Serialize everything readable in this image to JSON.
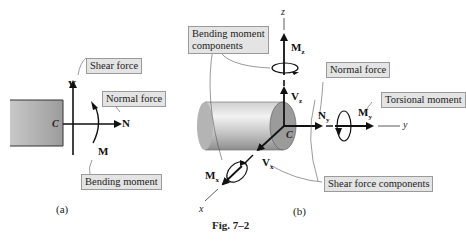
{
  "figure": {
    "title": "Fig. 7–2",
    "panel_a": {
      "caption": "(a)",
      "point_label": "C",
      "symbols": {
        "shear": "V",
        "normal": "N",
        "moment": "M"
      },
      "callouts": {
        "shear_force": "Shear force",
        "normal_force": "Normal force",
        "bending_moment": "Bending moment"
      }
    },
    "panel_b": {
      "caption": "(b)",
      "point_label": "C",
      "axes": {
        "x": "x",
        "y": "y",
        "z": "z"
      },
      "symbols": {
        "Mz": "M",
        "Mz_sub": "z",
        "Vz": "V",
        "Vz_sub": "z",
        "Ny": "N",
        "Ny_sub": "y",
        "My": "M",
        "My_sub": "y",
        "Vx": "V",
        "Vx_sub": "x",
        "Mx": "M",
        "Mx_sub": "x"
      },
      "callouts": {
        "bending_moment_components_line1": "Bending moment",
        "bending_moment_components_line2": "components",
        "normal_force": "Normal force",
        "torsional_moment": "Torsional moment",
        "shear_force_components": "Shear force components"
      }
    }
  },
  "colors": {
    "callout_bg": "#e4e4e4",
    "body_gray": "#9b9b9b",
    "cylinder_light": "#e6e6e6"
  }
}
